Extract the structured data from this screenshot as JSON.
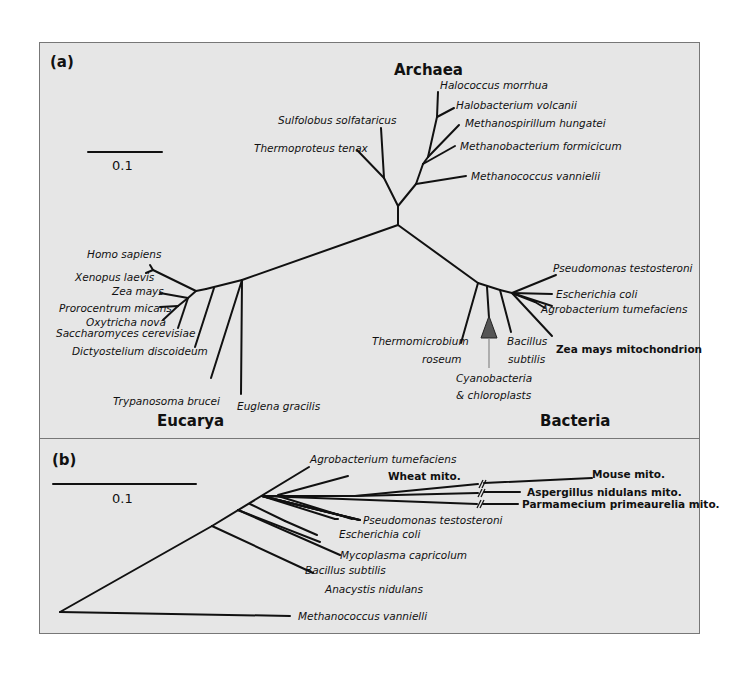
{
  "figure": {
    "panel_a": {
      "label": "(a)",
      "scale_bar": "0.1",
      "domains": {
        "archaea": "Archaea",
        "eucarya": "Eucarya",
        "bacteria": "Bacteria"
      },
      "archaea_taxa": [
        "Halococcus morrhua",
        "Halobacterium volcanii",
        "Methanospirillum hungatei",
        "Methanobacterium formicicum",
        "Methanococcus vannielii",
        "Sulfolobus solfataricus",
        "Thermoproteus tenax"
      ],
      "eucarya_taxa": [
        "Homo sapiens",
        "Xenopus laevis",
        "Zea mays",
        "Prorocentrum micans",
        "Oxytricha nova",
        "Saccharomyces cerevisiae",
        "Dictyostelium discoideum",
        "Trypanosoma brucei",
        "Euglena gracilis"
      ],
      "bacteria_taxa": [
        "Pseudomonas testosteroni",
        "Escherichia coli",
        "Agrobacterium tumefaciens",
        "Zea mays mitochondrion",
        "Bacillus",
        "subtilis",
        "Thermomicrobium",
        "roseum",
        "Cyanobacteria",
        "& chloroplasts"
      ]
    },
    "panel_b": {
      "label": "(b)",
      "scale_bar": "0.1",
      "taxa": [
        "Agrobacterium tumefaciens",
        "Wheat mito.",
        "Mouse mito.",
        "Aspergillus nidulans mito.",
        "Parmamecium primeaurelia mito.",
        "Pseudomonas testosteroni",
        "Escherichia coli",
        "Mycoplasma capricolum",
        "Bacillus subtilis",
        "Anacystis nidulans",
        "Methanococcus vannielli"
      ]
    },
    "colors": {
      "panel_bg": "#e6e6e6",
      "line": "#111111",
      "triangle": "#555555",
      "arrow": "#888888"
    }
  }
}
